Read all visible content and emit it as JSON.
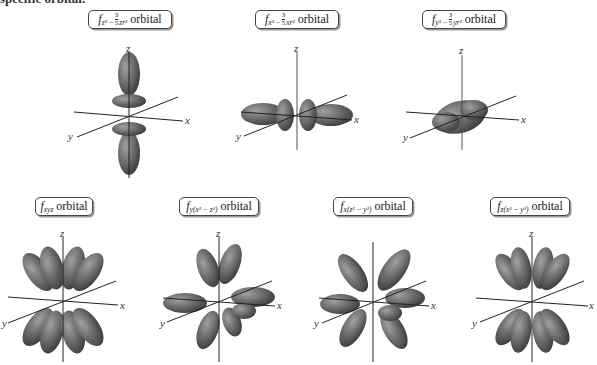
{
  "heading": "specific orbital.",
  "orbitals": [
    {
      "id": "fz3",
      "symbol": "f",
      "subscript_main": "z³ − ",
      "fraction": {
        "num": "3",
        "den": "5"
      },
      "subscript_tail": "zr²",
      "word": "orbital",
      "row": 1,
      "shape": "two-lobes-along-z-with-rings"
    },
    {
      "id": "fx3",
      "symbol": "f",
      "subscript_main": "x³ − ",
      "fraction": {
        "num": "3",
        "den": "5"
      },
      "subscript_tail": "xr²",
      "word": "orbital",
      "row": 1,
      "shape": "two-lobes-along-x-with-rings"
    },
    {
      "id": "fy3",
      "symbol": "f",
      "subscript_main": "y³ − ",
      "fraction": {
        "num": "3",
        "den": "5"
      },
      "subscript_tail": "yr²",
      "word": "orbital",
      "row": 1,
      "shape": "two-lobes-along-y-with-rings"
    },
    {
      "id": "fxyz",
      "symbol": "f",
      "subscript": "xyz",
      "word": "orbital",
      "row": 2,
      "shape": "eight-lobes"
    },
    {
      "id": "fyx2z2",
      "symbol": "f",
      "subscript": "y(x² − z²)",
      "word": "orbital",
      "row": 2,
      "shape": "eight-lobes"
    },
    {
      "id": "fxz2y2",
      "symbol": "f",
      "subscript": "x(z² − y²)",
      "word": "orbital",
      "row": 2,
      "shape": "eight-lobes"
    },
    {
      "id": "fzx2y2",
      "symbol": "f",
      "subscript": "z(x² − y²)",
      "word": "orbital",
      "row": 2,
      "shape": "eight-lobes"
    }
  ],
  "axes": {
    "x": "x",
    "y": "y",
    "z": "z"
  },
  "colors": {
    "lobe": "#6e6e6e",
    "lobe_dark": "#4a4a4a",
    "lobe_light": "#9a9a9a",
    "axis": "#222222",
    "label_border": "#444444"
  }
}
